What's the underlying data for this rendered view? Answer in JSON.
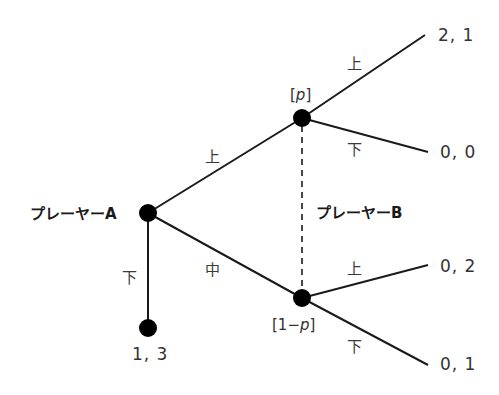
{
  "diagram": {
    "type": "extensive-form game tree",
    "players": {
      "a": {
        "label": "プレーヤーA"
      },
      "b": {
        "label": "プレーヤーB"
      }
    },
    "player_a_moves": {
      "up": "上",
      "middle": "中",
      "down": "下"
    },
    "player_b_moves": {
      "upper_node": {
        "up": "上",
        "down": "下"
      },
      "lower_node": {
        "up": "上",
        "down": "下"
      }
    },
    "beliefs": {
      "upper": {
        "open": "[",
        "var": "p",
        "close": "]"
      },
      "lower": {
        "open": "[1−",
        "var": "p",
        "close": "]"
      }
    },
    "payoffs": {
      "a_down": "1, 3",
      "up_up": "2, 1",
      "up_down": "0, 0",
      "mid_up": "0, 2",
      "mid_down": "0, 1"
    },
    "colors": {
      "line": "#1a1a1a",
      "node": "#000000",
      "text": "#333333"
    }
  }
}
